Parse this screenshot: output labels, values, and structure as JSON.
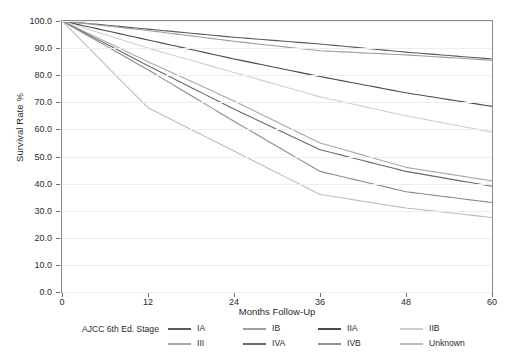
{
  "chart_data": {
    "type": "line",
    "title": "",
    "xlabel": "Months Follow-Up",
    "ylabel": "Survival Rate %",
    "xlim": [
      0,
      60
    ],
    "ylim": [
      0,
      100
    ],
    "x_ticks": [
      "0",
      "12",
      "24",
      "36",
      "48",
      "60"
    ],
    "y_ticks": [
      "0.0",
      "10.0",
      "20.0",
      "30.0",
      "40.0",
      "50.0",
      "60.0",
      "70.0",
      "80.0",
      "90.0",
      "100.0"
    ],
    "grid": true,
    "legend_position": "bottom",
    "legend_title": "AJCC 6th Ed. Stage",
    "x": [
      0,
      12,
      24,
      36,
      48,
      60
    ],
    "series": [
      {
        "name": "IA",
        "color": "#5a5a5a",
        "values": [
          100.0,
          97.0,
          94.0,
          91.5,
          88.5,
          86.0
        ]
      },
      {
        "name": "IB",
        "color": "#9e9e9e",
        "values": [
          100.0,
          96.5,
          92.5,
          89.0,
          87.5,
          85.5
        ]
      },
      {
        "name": "IIA",
        "color": "#4a4a4a",
        "values": [
          100.0,
          93.0,
          86.0,
          79.5,
          73.5,
          68.5
        ]
      },
      {
        "name": "IIB",
        "color": "#cfcfcf",
        "values": [
          100.0,
          90.0,
          81.0,
          72.0,
          65.0,
          59.0
        ]
      },
      {
        "name": "III",
        "color": "#a8a8a8",
        "values": [
          100.0,
          85.0,
          70.5,
          55.0,
          46.0,
          41.0
        ]
      },
      {
        "name": "IVA",
        "color": "#6a6a6a",
        "values": [
          100.0,
          83.5,
          67.5,
          52.5,
          44.5,
          39.0
        ]
      },
      {
        "name": "IVB",
        "color": "#8c8c8c",
        "values": [
          100.0,
          82.0,
          63.0,
          44.5,
          37.0,
          33.0
        ]
      },
      {
        "name": "Unknown",
        "color": "#bdbdbd",
        "values": [
          100.0,
          68.0,
          52.0,
          36.0,
          31.0,
          27.5
        ]
      }
    ]
  },
  "axes": {
    "y_label": "Survival Rate %",
    "x_label": "Months Follow-Up",
    "y_ticks": [
      "100.0",
      "90.0",
      "80.0",
      "70.0",
      "60.0",
      "50.0",
      "40.0",
      "30.0",
      "20.0",
      "10.0",
      "0.0"
    ],
    "x_ticks": [
      "0",
      "12",
      "24",
      "36",
      "48",
      "60"
    ]
  },
  "legend": {
    "title": "AJCC 6th Ed. Stage",
    "items": [
      {
        "label": "IA",
        "color": "#5a5a5a"
      },
      {
        "label": "IB",
        "color": "#9e9e9e"
      },
      {
        "label": "IIA",
        "color": "#4a4a4a"
      },
      {
        "label": "IIB",
        "color": "#cfcfcf"
      },
      {
        "label": "III",
        "color": "#a8a8a8"
      },
      {
        "label": "IVA",
        "color": "#6a6a6a"
      },
      {
        "label": "IVB",
        "color": "#8c8c8c"
      },
      {
        "label": "Unknown",
        "color": "#bdbdbd"
      }
    ]
  }
}
